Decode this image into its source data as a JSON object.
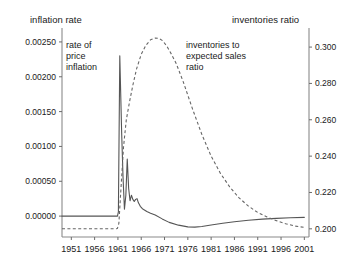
{
  "chart_data": {
    "type": "line",
    "title": "",
    "xlabel": "",
    "ylabel": "inflation rate",
    "y2label": "inventories ratio",
    "grid": false,
    "legend_position": "inline-annotations",
    "xlim": [
      1949,
      2002
    ],
    "x_ticks": [
      "1951",
      "1956",
      "1961",
      "1966",
      "1971",
      "1976",
      "1981",
      "1986",
      "1991",
      "1996",
      "2001"
    ],
    "ylim": [
      -0.0003,
      0.0027
    ],
    "y_ticks": [
      "0.00000",
      "0.00050",
      "0.00100",
      "0.00150",
      "0.00200",
      "0.00250"
    ],
    "y2lim": [
      0.1955,
      0.3105
    ],
    "y2_ticks": [
      "0.200",
      "0.220",
      "0.240",
      "0.260",
      "0.280",
      "0.300"
    ],
    "annotations": [
      {
        "name": "rate-of-price-inflation",
        "lines": [
          "rate of",
          "price",
          "inflation"
        ],
        "x": 66,
        "y": 48
      },
      {
        "name": "inventories-to-expected-sales-ratio",
        "lines": [
          "inventories to",
          "expected sales",
          "ratio"
        ],
        "x": 186,
        "y": 48
      }
    ],
    "series": [
      {
        "name": "rate of price inflation",
        "axis": "left",
        "style": "solid",
        "x": [
          1949.0,
          1951.0,
          1956.0,
          1959.0,
          1960.6,
          1960.9,
          1961.1,
          1961.4,
          1961.8,
          1962.1,
          1962.4,
          1962.7,
          1963.0,
          1963.3,
          1963.6,
          1963.9,
          1964.2,
          1964.5,
          1964.8,
          1965.1,
          1965.4,
          1965.8,
          1966.2,
          1966.6,
          1967.2,
          1968.0,
          1969.0,
          1970.5,
          1972.0,
          1974.0,
          1976.0,
          1977.5,
          1979.0,
          1981.0,
          1983.5,
          1986.0,
          1989.0,
          1992.0,
          1995.0,
          1998.0,
          2001.0
        ],
        "y": [
          0.0,
          0.0,
          0.0,
          0.0,
          0.0,
          0.0,
          6e-05,
          0.0023,
          0.0012,
          0.00055,
          0.0001,
          0.0003,
          0.00082,
          0.0004,
          0.00022,
          0.0003,
          0.00024,
          0.00021,
          0.00024,
          0.00025,
          0.00019,
          0.00014,
          0.00011,
          9e-05,
          6.5e-05,
          4e-05,
          1.5e-05,
          -4e-05,
          -9e-05,
          -0.00013,
          -0.000155,
          -0.000158,
          -0.00015,
          -0.000128,
          -0.000102,
          -8.2e-05,
          -6e-05,
          -4.4e-05,
          -3.2e-05,
          -2.4e-05,
          -1.8e-05
        ]
      },
      {
        "name": "inventories to expected sales ratio",
        "axis": "right",
        "style": "dashed",
        "x": [
          1949.0,
          1951.0,
          1956.0,
          1959.0,
          1960.6,
          1960.9,
          1961.2,
          1961.6,
          1962.2,
          1962.8,
          1963.5,
          1964.2,
          1965.0,
          1966.0,
          1967.0,
          1968.0,
          1969.0,
          1969.8,
          1970.6,
          1971.5,
          1972.5,
          1973.5,
          1975.0,
          1977.0,
          1979.0,
          1981.0,
          1983.0,
          1985.0,
          1987.0,
          1989.0,
          1991.0,
          1993.0,
          1995.0,
          1997.0,
          1999.0,
          2001.0
        ],
        "y": [
          0.2,
          0.2,
          0.2,
          0.2,
          0.2,
          0.2002,
          0.203,
          0.22,
          0.245,
          0.26,
          0.27,
          0.279,
          0.288,
          0.296,
          0.301,
          0.304,
          0.305,
          0.3048,
          0.3035,
          0.3005,
          0.296,
          0.291,
          0.281,
          0.266,
          0.252,
          0.24,
          0.2305,
          0.223,
          0.217,
          0.2125,
          0.209,
          0.2065,
          0.2045,
          0.2028,
          0.2015,
          0.2008
        ]
      }
    ]
  },
  "axes": {
    "left_title": "inflation rate",
    "right_title": "inventories ratio"
  }
}
